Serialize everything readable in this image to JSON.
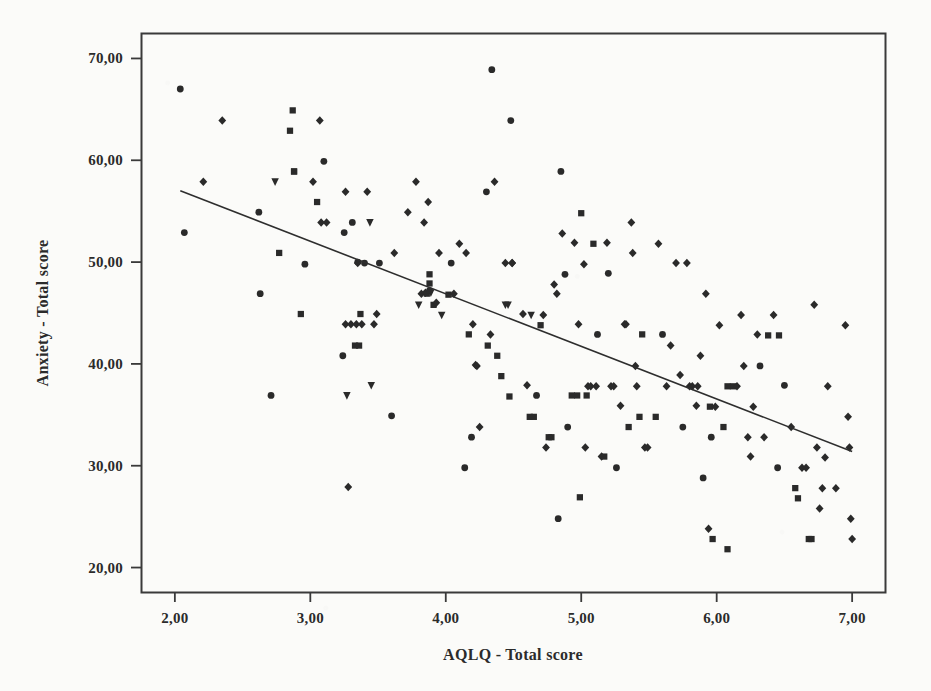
{
  "chart_data": {
    "type": "scatter",
    "title": "",
    "xlabel": "AQLQ - Total score",
    "ylabel": "Anxiety - Total score",
    "xlim": [
      1.75,
      7.25
    ],
    "ylim": [
      17.5,
      72.5
    ],
    "grid": false,
    "legend": "none",
    "x_ticks": [
      "2,00",
      "3,00",
      "4,00",
      "5,00",
      "6,00",
      "7,00"
    ],
    "x_tick_values": [
      2,
      3,
      4,
      5,
      6,
      7
    ],
    "y_ticks": [
      "20,00",
      "30,00",
      "40,00",
      "50,00",
      "60,00",
      "70,00"
    ],
    "y_tick_values": [
      20,
      30,
      40,
      50,
      60,
      70
    ],
    "decimal_separator": ",",
    "marker_color": "#2a2a2a",
    "line_color": "#2e2e2e",
    "frame_color": "#3a3a3a",
    "background_color": "#fbfbf9",
    "n_points": 190,
    "fit_line": {
      "type": "linear-regression",
      "x_start": 2.04,
      "y_start": 57.0,
      "x_end": 7.0,
      "y_end": 31.4,
      "slope": -5.16,
      "intercept": 67.5
    },
    "marker_shapes": [
      "circle",
      "square",
      "diamond",
      "triangle-down"
    ],
    "points": [
      [
        2.04,
        67.0,
        "circle"
      ],
      [
        2.07,
        52.9,
        "circle"
      ],
      [
        2.21,
        57.9,
        "diamond"
      ],
      [
        2.35,
        63.9,
        "diamond"
      ],
      [
        2.62,
        54.9,
        "circle"
      ],
      [
        2.63,
        46.9,
        "circle"
      ],
      [
        2.71,
        36.9,
        "circle"
      ],
      [
        2.74,
        57.9,
        "triangle-down"
      ],
      [
        2.77,
        50.9,
        "square"
      ],
      [
        2.85,
        62.9,
        "square"
      ],
      [
        2.87,
        64.9,
        "square"
      ],
      [
        2.88,
        58.9,
        "square"
      ],
      [
        2.93,
        44.9,
        "square"
      ],
      [
        2.96,
        49.8,
        "circle"
      ],
      [
        3.02,
        57.9,
        "diamond"
      ],
      [
        3.05,
        55.9,
        "square"
      ],
      [
        3.07,
        63.9,
        "diamond"
      ],
      [
        3.08,
        53.9,
        "diamond"
      ],
      [
        3.1,
        59.9,
        "circle"
      ],
      [
        3.12,
        53.9,
        "diamond"
      ],
      [
        3.24,
        40.8,
        "circle"
      ],
      [
        3.25,
        52.9,
        "circle"
      ],
      [
        3.26,
        56.9,
        "diamond"
      ],
      [
        3.26,
        43.9,
        "diamond"
      ],
      [
        3.27,
        36.9,
        "triangle-down"
      ],
      [
        3.28,
        27.9,
        "diamond"
      ],
      [
        3.3,
        43.9,
        "diamond"
      ],
      [
        3.31,
        53.9,
        "circle"
      ],
      [
        3.33,
        41.8,
        "square"
      ],
      [
        3.34,
        43.9,
        "diamond"
      ],
      [
        3.35,
        50.0,
        "circle"
      ],
      [
        3.36,
        41.8,
        "square"
      ],
      [
        3.37,
        44.9,
        "square"
      ],
      [
        3.38,
        43.9,
        "diamond"
      ],
      [
        3.4,
        49.9,
        "circle"
      ],
      [
        3.42,
        56.9,
        "diamond"
      ],
      [
        3.44,
        53.9,
        "triangle-down"
      ],
      [
        3.45,
        37.9,
        "triangle-down"
      ],
      [
        3.47,
        43.9,
        "diamond"
      ],
      [
        3.49,
        44.9,
        "diamond"
      ],
      [
        3.51,
        49.9,
        "circle"
      ],
      [
        3.6,
        34.9,
        "circle"
      ],
      [
        3.62,
        50.9,
        "diamond"
      ],
      [
        3.72,
        54.9,
        "diamond"
      ],
      [
        3.78,
        57.9,
        "diamond"
      ],
      [
        3.8,
        45.8,
        "triangle-down"
      ],
      [
        3.82,
        46.9,
        "diamond"
      ],
      [
        3.84,
        53.9,
        "diamond"
      ],
      [
        3.85,
        47.0,
        "diamond"
      ],
      [
        3.86,
        46.9,
        "square"
      ],
      [
        3.87,
        55.9,
        "diamond"
      ],
      [
        3.88,
        47.9,
        "square"
      ],
      [
        3.88,
        48.8,
        "square"
      ],
      [
        3.89,
        47.0,
        "triangle-down"
      ],
      [
        3.91,
        45.8,
        "square"
      ],
      [
        3.93,
        46.0,
        "diamond"
      ],
      [
        3.95,
        50.9,
        "diamond"
      ],
      [
        3.97,
        44.8,
        "triangle-down"
      ],
      [
        4.02,
        46.8,
        "square"
      ],
      [
        4.04,
        49.9,
        "circle"
      ],
      [
        4.06,
        46.9,
        "diamond"
      ],
      [
        4.1,
        51.8,
        "diamond"
      ],
      [
        4.14,
        29.8,
        "circle"
      ],
      [
        4.15,
        50.9,
        "diamond"
      ],
      [
        4.17,
        42.9,
        "square"
      ],
      [
        4.19,
        32.8,
        "circle"
      ],
      [
        4.2,
        43.9,
        "diamond"
      ],
      [
        4.22,
        39.9,
        "diamond"
      ],
      [
        4.23,
        39.8,
        "diamond"
      ],
      [
        4.25,
        33.8,
        "diamond"
      ],
      [
        4.3,
        56.9,
        "circle"
      ],
      [
        4.31,
        41.8,
        "square"
      ],
      [
        4.33,
        42.9,
        "diamond"
      ],
      [
        4.34,
        68.9,
        "circle"
      ],
      [
        4.36,
        57.9,
        "diamond"
      ],
      [
        4.38,
        40.8,
        "square"
      ],
      [
        4.41,
        38.8,
        "square"
      ],
      [
        4.44,
        49.9,
        "diamond"
      ],
      [
        4.46,
        45.8,
        "triangle-down"
      ],
      [
        4.47,
        36.8,
        "square"
      ],
      [
        4.48,
        63.9,
        "circle"
      ],
      [
        4.49,
        49.9,
        "diamond"
      ],
      [
        4.57,
        44.9,
        "diamond"
      ],
      [
        4.6,
        37.9,
        "diamond"
      ],
      [
        4.62,
        34.8,
        "square"
      ],
      [
        4.63,
        44.8,
        "triangle-down"
      ],
      [
        4.65,
        34.8,
        "square"
      ],
      [
        4.67,
        36.9,
        "circle"
      ],
      [
        4.7,
        43.8,
        "square"
      ],
      [
        4.72,
        44.8,
        "diamond"
      ],
      [
        4.74,
        31.8,
        "diamond"
      ],
      [
        4.76,
        32.8,
        "square"
      ],
      [
        4.78,
        32.8,
        "square"
      ],
      [
        4.8,
        47.8,
        "diamond"
      ],
      [
        4.82,
        46.9,
        "diamond"
      ],
      [
        4.83,
        24.8,
        "circle"
      ],
      [
        4.85,
        58.9,
        "circle"
      ],
      [
        4.86,
        52.8,
        "diamond"
      ],
      [
        4.88,
        48.8,
        "circle"
      ],
      [
        4.9,
        33.8,
        "circle"
      ],
      [
        4.93,
        36.9,
        "square"
      ],
      [
        4.95,
        51.9,
        "diamond"
      ],
      [
        4.97,
        36.9,
        "square"
      ],
      [
        4.98,
        43.9,
        "diamond"
      ],
      [
        4.99,
        26.9,
        "square"
      ],
      [
        5.0,
        54.8,
        "square"
      ],
      [
        5.02,
        49.8,
        "diamond"
      ],
      [
        5.03,
        31.8,
        "diamond"
      ],
      [
        5.04,
        36.9,
        "square"
      ],
      [
        5.05,
        37.8,
        "diamond"
      ],
      [
        5.07,
        37.8,
        "diamond"
      ],
      [
        5.09,
        51.8,
        "square"
      ],
      [
        5.12,
        42.9,
        "circle"
      ],
      [
        5.15,
        30.9,
        "diamond"
      ],
      [
        5.17,
        30.9,
        "square"
      ],
      [
        5.19,
        51.9,
        "diamond"
      ],
      [
        5.2,
        48.9,
        "circle"
      ],
      [
        5.22,
        37.8,
        "diamond"
      ],
      [
        5.24,
        37.8,
        "diamond"
      ],
      [
        5.26,
        29.8,
        "circle"
      ],
      [
        5.29,
        35.9,
        "diamond"
      ],
      [
        5.32,
        43.9,
        "diamond"
      ],
      [
        5.35,
        33.8,
        "square"
      ],
      [
        5.37,
        53.9,
        "diamond"
      ],
      [
        5.38,
        50.9,
        "diamond"
      ],
      [
        5.4,
        39.8,
        "diamond"
      ],
      [
        5.41,
        37.8,
        "diamond"
      ],
      [
        5.43,
        34.8,
        "square"
      ],
      [
        5.45,
        42.9,
        "square"
      ],
      [
        5.47,
        31.8,
        "diamond"
      ],
      [
        5.49,
        31.8,
        "diamond"
      ],
      [
        5.55,
        34.8,
        "square"
      ],
      [
        5.57,
        51.8,
        "diamond"
      ],
      [
        5.6,
        42.9,
        "circle"
      ],
      [
        5.63,
        37.8,
        "diamond"
      ],
      [
        5.66,
        41.8,
        "diamond"
      ],
      [
        5.7,
        49.9,
        "diamond"
      ],
      [
        5.73,
        38.9,
        "diamond"
      ],
      [
        5.75,
        33.8,
        "circle"
      ],
      [
        5.78,
        49.9,
        "diamond"
      ],
      [
        5.8,
        37.8,
        "diamond"
      ],
      [
        5.82,
        37.8,
        "diamond"
      ],
      [
        5.85,
        35.9,
        "diamond"
      ],
      [
        5.88,
        40.8,
        "diamond"
      ],
      [
        5.9,
        28.8,
        "circle"
      ],
      [
        5.92,
        46.9,
        "diamond"
      ],
      [
        5.94,
        23.8,
        "diamond"
      ],
      [
        5.95,
        35.8,
        "square"
      ],
      [
        5.96,
        32.8,
        "circle"
      ],
      [
        5.97,
        22.8,
        "square"
      ],
      [
        5.99,
        35.8,
        "diamond"
      ],
      [
        6.02,
        43.8,
        "diamond"
      ],
      [
        6.05,
        33.8,
        "square"
      ],
      [
        6.08,
        21.8,
        "square"
      ],
      [
        6.12,
        37.8,
        "square"
      ],
      [
        6.15,
        37.8,
        "diamond"
      ],
      [
        6.18,
        44.8,
        "diamond"
      ],
      [
        6.2,
        39.8,
        "diamond"
      ],
      [
        6.23,
        32.8,
        "diamond"
      ],
      [
        6.25,
        30.9,
        "diamond"
      ],
      [
        6.27,
        35.8,
        "diamond"
      ],
      [
        6.3,
        42.9,
        "diamond"
      ],
      [
        6.32,
        39.8,
        "circle"
      ],
      [
        6.35,
        32.8,
        "diamond"
      ],
      [
        6.38,
        42.8,
        "square"
      ],
      [
        6.42,
        44.8,
        "diamond"
      ],
      [
        6.45,
        29.8,
        "circle"
      ],
      [
        6.5,
        37.9,
        "circle"
      ],
      [
        6.55,
        33.8,
        "diamond"
      ],
      [
        6.58,
        27.8,
        "square"
      ],
      [
        6.6,
        26.8,
        "square"
      ],
      [
        6.63,
        29.8,
        "diamond"
      ],
      [
        6.66,
        29.8,
        "diamond"
      ],
      [
        6.68,
        22.8,
        "square"
      ],
      [
        6.7,
        22.8,
        "square"
      ],
      [
        6.72,
        45.8,
        "diamond"
      ],
      [
        6.74,
        31.8,
        "diamond"
      ],
      [
        6.76,
        25.8,
        "diamond"
      ],
      [
        6.78,
        27.8,
        "diamond"
      ],
      [
        6.8,
        30.8,
        "diamond"
      ],
      [
        6.82,
        37.8,
        "diamond"
      ],
      [
        6.88,
        27.8,
        "diamond"
      ],
      [
        6.95,
        43.8,
        "diamond"
      ],
      [
        6.97,
        34.8,
        "diamond"
      ],
      [
        6.98,
        31.8,
        "diamond"
      ],
      [
        6.99,
        24.8,
        "diamond"
      ],
      [
        7.0,
        22.8,
        "diamond"
      ],
      [
        4.49,
        49.9,
        "diamond"
      ],
      [
        3.88,
        47.2,
        "circle"
      ],
      [
        5.11,
        37.8,
        "diamond"
      ],
      [
        6.08,
        37.8,
        "square"
      ],
      [
        4.44,
        45.8,
        "triangle-down"
      ],
      [
        5.33,
        43.9,
        "diamond"
      ],
      [
        3.35,
        49.9,
        "diamond"
      ],
      [
        2.88,
        58.9,
        "square"
      ],
      [
        6.46,
        42.8,
        "square"
      ],
      [
        5.86,
        37.8,
        "diamond"
      ]
    ]
  },
  "plot": {
    "frame": {
      "left": 141,
      "top": 33,
      "right": 886,
      "bottom": 593
    },
    "x_tick_px": [
      176,
      310,
      445,
      579,
      714,
      848
    ],
    "y_tick_px": [
      542,
      446,
      350,
      254,
      158,
      62
    ]
  }
}
